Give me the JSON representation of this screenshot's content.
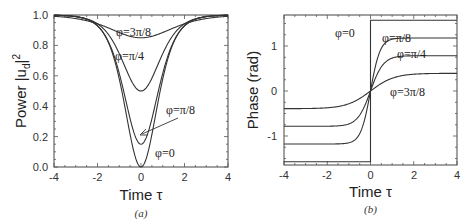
{
  "chart_data": [
    {
      "type": "line",
      "panel": "(a)",
      "xlabel": "Time τ",
      "ylabel": "Power |u_d|²",
      "xlim": [
        -4,
        4
      ],
      "ylim": [
        0.0,
        1.0
      ],
      "xticks": [
        "-4",
        "-2",
        "0",
        "2",
        "4"
      ],
      "yticks": [
        "0.0",
        "0.2",
        "0.4",
        "0.6",
        "0.8",
        "1.0"
      ],
      "grid": false,
      "series": [
        {
          "name": "φ=0",
          "min_at_0": 0.0,
          "x": [
            -4,
            -3,
            -2,
            -1.5,
            -1,
            -0.5,
            0,
            0.5,
            1,
            1.5,
            2,
            3,
            4
          ],
          "values": [
            1.0,
            0.99,
            0.93,
            0.82,
            0.58,
            0.21,
            0.0,
            0.21,
            0.58,
            0.82,
            0.93,
            0.99,
            1.0
          ]
        },
        {
          "name": "φ=π/8",
          "min_at_0": 0.15,
          "x": [
            -4,
            -3,
            -2,
            -1.5,
            -1,
            -0.5,
            0,
            0.5,
            1,
            1.5,
            2,
            3,
            4
          ],
          "values": [
            0.99,
            0.98,
            0.92,
            0.82,
            0.62,
            0.32,
            0.15,
            0.32,
            0.62,
            0.82,
            0.92,
            0.98,
            0.99
          ]
        },
        {
          "name": "φ=π/4",
          "min_at_0": 0.5,
          "x": [
            -4,
            -3,
            -2,
            -1.5,
            -1,
            -0.5,
            0,
            0.5,
            1,
            1.5,
            2,
            3,
            4
          ],
          "values": [
            0.98,
            0.96,
            0.9,
            0.83,
            0.72,
            0.56,
            0.5,
            0.56,
            0.72,
            0.83,
            0.9,
            0.96,
            0.98
          ]
        },
        {
          "name": "φ=3π/8",
          "min_at_0": 0.85,
          "x": [
            -4,
            -3,
            -2,
            -1.5,
            -1,
            -0.5,
            0,
            0.5,
            1,
            1.5,
            2,
            3,
            4
          ],
          "values": [
            0.99,
            0.97,
            0.93,
            0.9,
            0.875,
            0.86,
            0.855,
            0.86,
            0.875,
            0.9,
            0.93,
            0.97,
            0.99
          ]
        }
      ],
      "annotations": [
        "φ=3π/8",
        "φ=π/4",
        "φ=π/8",
        "φ=0"
      ],
      "caption": "(a)"
    },
    {
      "type": "line",
      "panel": "(b)",
      "xlabel": "Time τ",
      "ylabel": "Phase (rad)",
      "xlim": [
        -4,
        4
      ],
      "ylim": [
        -1.65,
        1.69
      ],
      "xticks": [
        "-4",
        "-2",
        "0",
        "2",
        "4"
      ],
      "yticks": [
        "-1",
        "0",
        "1"
      ],
      "grid": false,
      "series": [
        {
          "name": "φ=0",
          "asymptote": 1.571,
          "x": [
            -4,
            -0.001,
            0,
            0.001,
            4
          ],
          "values": [
            -1.571,
            -1.571,
            0,
            1.571,
            1.571
          ]
        },
        {
          "name": "φ=π/8",
          "asymptote": 1.178,
          "x": [
            -4,
            -2,
            -1,
            -0.5,
            0,
            0.5,
            1,
            2,
            4
          ],
          "values": [
            -1.18,
            -1.16,
            -1.05,
            -0.75,
            0,
            0.75,
            1.05,
            1.16,
            1.18
          ]
        },
        {
          "name": "φ=π/4",
          "asymptote": 0.785,
          "x": [
            -4,
            -2,
            -1,
            -0.5,
            0,
            0.5,
            1,
            2,
            4
          ],
          "values": [
            -0.78,
            -0.74,
            -0.6,
            -0.38,
            0,
            0.38,
            0.6,
            0.74,
            0.78
          ]
        },
        {
          "name": "φ=3π/8",
          "asymptote": 0.393,
          "x": [
            -4,
            -2,
            -1,
            -0.5,
            0,
            0.5,
            1,
            2,
            4
          ],
          "values": [
            -0.38,
            -0.32,
            -0.22,
            -0.12,
            0,
            0.12,
            0.22,
            0.32,
            0.38
          ]
        }
      ],
      "annotations": [
        "φ=0",
        "φ=π/8",
        "φ=π/4",
        "φ=3π/8"
      ],
      "caption": "(b)"
    }
  ],
  "labels": {
    "a": {
      "ylabel": "Power |u",
      "ylabel_sub": "d",
      "ylabel_sup": "2",
      "ylabel_end": "|",
      "xlabel": "Time τ",
      "caption": "(a)",
      "yticks": [
        "0.0",
        "0.2",
        "0.4",
        "0.6",
        "0.8",
        "1.0"
      ],
      "xticks": [
        "-4",
        "-2",
        "0",
        "2",
        "4"
      ],
      "ann": {
        "p3": "φ=3π/8",
        "p2": "φ=π/4",
        "p1": "φ=π/8",
        "p0": "φ=0"
      }
    },
    "b": {
      "ylabel": "Phase (rad)",
      "xlabel": "Time τ",
      "caption": "(b)",
      "yticks": [
        "1",
        "0",
        "-1"
      ],
      "xticks": [
        "-4",
        "-2",
        "0",
        "2",
        "4"
      ],
      "ann": {
        "p0": "φ=0",
        "p1": "φ=π/8",
        "p2": "φ=π/4",
        "p3": "φ=3π/8"
      }
    }
  }
}
